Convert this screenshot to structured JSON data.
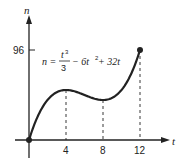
{
  "chart_data": {
    "type": "line",
    "title": "",
    "equation": "n = t^3/3 - 6t^2 + 32t",
    "xlabel": "t",
    "ylabel": "n",
    "x_ticks": [
      "4",
      "8",
      "12"
    ],
    "y_ticks": [
      "96"
    ],
    "xlim": [
      0,
      12
    ],
    "ylim": [
      0,
      96
    ],
    "grid": false,
    "legend": "none",
    "series": [
      {
        "name": "n(t)",
        "x": [
          0,
          1,
          2,
          3,
          4,
          5,
          6,
          7,
          8,
          9,
          10,
          11,
          12
        ],
        "values": [
          0,
          26.33,
          42.67,
          51.0,
          53.33,
          51.67,
          48.0,
          44.33,
          42.67,
          45.0,
          53.33,
          69.67,
          96.0
        ]
      }
    ],
    "annotations": [
      {
        "type": "dashed-vline",
        "x": 4,
        "y": 53.33
      },
      {
        "type": "dashed-vline",
        "x": 8,
        "y": 42.67
      },
      {
        "type": "dashed-vline",
        "x": 12,
        "y": 96
      },
      {
        "type": "point",
        "x": 0,
        "y": 0
      },
      {
        "type": "point",
        "x": 12,
        "y": 96
      }
    ]
  },
  "labels": {
    "y_axis": "n",
    "x_axis": "t",
    "y_tick_96": "96",
    "x_tick_4": "4",
    "x_tick_8": "8",
    "x_tick_12": "12",
    "eq_lhs": "n = ",
    "eq_num": "t",
    "eq_num_exp": "3",
    "eq_den": "3",
    "eq_rest": "− 6t",
    "eq_rest_exp": "2",
    "eq_tail": " + 32t"
  }
}
